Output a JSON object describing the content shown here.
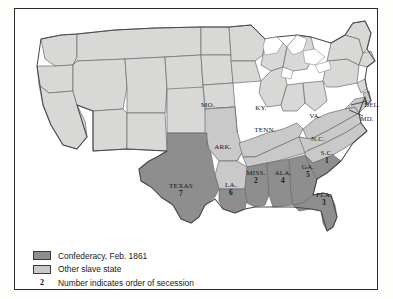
{
  "map": {
    "title": "Confederacy, Feb. 1861",
    "colors": {
      "confederate": "#8e8e8e",
      "other_slave": "#c9c9c9",
      "free_state": "#d8d8d6",
      "border_line": "#6b6b6b",
      "outline": "#4a4a4a",
      "water": "#ffffff",
      "frame": "#2a2a2a"
    },
    "labels": [
      {
        "name": "MO.",
        "number": "",
        "x": 193,
        "y": 97,
        "class": ""
      },
      {
        "name": "KY.",
        "number": "",
        "x": 246,
        "y": 100,
        "class": ""
      },
      {
        "name": "VA.",
        "number": "",
        "x": 300,
        "y": 108,
        "class": ""
      },
      {
        "name": "TENN.",
        "number": "",
        "x": 250,
        "y": 122,
        "class": ""
      },
      {
        "name": "N.C.",
        "number": "",
        "x": 303,
        "y": 131,
        "class": ""
      },
      {
        "name": "ARK.",
        "number": "",
        "x": 208,
        "y": 139,
        "class": ""
      },
      {
        "name": "S.C.",
        "number": "1",
        "x": 312,
        "y": 148,
        "class": ""
      },
      {
        "name": "MISS.",
        "number": "2",
        "x": 241,
        "y": 168,
        "class": ""
      },
      {
        "name": "ALA.",
        "number": "4",
        "x": 268,
        "y": 168,
        "class": ""
      },
      {
        "name": "GA.",
        "number": "5",
        "x": 293,
        "y": 162,
        "class": ""
      },
      {
        "name": "LA.",
        "number": "6",
        "x": 216,
        "y": 180,
        "class": ""
      },
      {
        "name": "TEXAS",
        "number": "7",
        "x": 166,
        "y": 181,
        "class": ""
      },
      {
        "name": "FLA.",
        "number": "3",
        "x": 309,
        "y": 190,
        "class": ""
      },
      {
        "name": "DEL.",
        "number": "",
        "x": 357,
        "y": 96,
        "class": "sm"
      },
      {
        "name": "MD.",
        "number": "",
        "x": 352,
        "y": 110,
        "class": "sm"
      }
    ]
  },
  "legend": {
    "items": [
      {
        "swatch": "confederate",
        "label": "Confederacy, Feb. 1861"
      },
      {
        "swatch": "other_slave",
        "label": "Other slave state"
      }
    ],
    "key_number": "2",
    "key_label": "Number indicates order of secession"
  }
}
